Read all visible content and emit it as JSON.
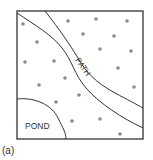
{
  "diagram": {
    "frame": {
      "x": 17,
      "y": 11,
      "w": 126,
      "h": 128,
      "stroke": "#333333"
    },
    "path_label": "PATH",
    "pond_label": "POND",
    "caption": "(a)",
    "dot_color": "#8a8a8a",
    "dots": [
      [
        23,
        24
      ],
      [
        68,
        21
      ],
      [
        96,
        19
      ],
      [
        127,
        21
      ],
      [
        37,
        42
      ],
      [
        83,
        34
      ],
      [
        114,
        36
      ],
      [
        25,
        62
      ],
      [
        54,
        61
      ],
      [
        100,
        49
      ],
      [
        131,
        51
      ],
      [
        65,
        78
      ],
      [
        118,
        68
      ],
      [
        39,
        85
      ],
      [
        79,
        95
      ],
      [
        134,
        87
      ],
      [
        56,
        102
      ],
      [
        72,
        121
      ],
      [
        100,
        119
      ],
      [
        120,
        134
      ]
    ]
  }
}
